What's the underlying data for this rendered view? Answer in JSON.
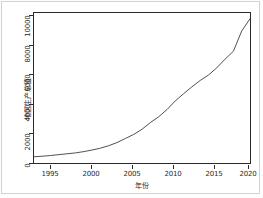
{
  "chart_data": {
    "type": "line",
    "title": "",
    "subtitle": "",
    "xlabel": "年份",
    "ylabel": "地区生产总值",
    "xlim": [
      1994,
      2020
    ],
    "ylim": [
      0,
      10400
    ],
    "grid": false,
    "legend": null,
    "legend_position": "none",
    "line_color": "#3b3b3b",
    "panel_border_color": "#2b2b2b",
    "background_color": "#ffffff",
    "xticks": [
      1995,
      2000,
      2005,
      2010,
      2015,
      2020
    ],
    "xtick_labels": [
      "1995",
      "2000",
      "2005",
      "2010",
      "2015",
      "2020"
    ],
    "yticks": [
      0,
      2000,
      4000,
      6000,
      8000,
      10000
    ],
    "ytick_labels": [
      "0",
      "2000",
      "4000",
      "6000",
      "8000",
      "10000"
    ],
    "series": [
      {
        "name": "地区生产总值",
        "x": [
          1994,
          1995,
          1996,
          1997,
          1998,
          1999,
          2000,
          2001,
          2002,
          2003,
          2004,
          2005,
          2006,
          2007,
          2008,
          2009,
          2010,
          2011,
          2012,
          2013,
          2014,
          2015,
          2016,
          2017,
          2018,
          2019,
          2020
        ],
        "values": [
          430,
          470,
          520,
          580,
          640,
          700,
          790,
          900,
          1030,
          1200,
          1420,
          1700,
          1980,
          2340,
          2800,
          3200,
          3700,
          4300,
          4800,
          5280,
          5720,
          6100,
          6600,
          7200,
          7750,
          9150,
          10000
        ]
      }
    ]
  }
}
